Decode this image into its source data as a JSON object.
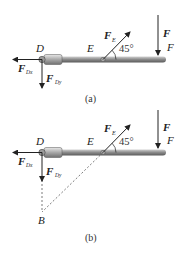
{
  "figure_a": {
    "caption": "(a)",
    "points": {
      "D": "D",
      "E": "E",
      "F": "F"
    },
    "forces": {
      "F_E": {
        "main": "F",
        "sub": "E"
      },
      "F": {
        "main": "F"
      },
      "F_Dx": {
        "main": "F",
        "sub": "Dx"
      },
      "F_Dy": {
        "main": "F",
        "sub": "Dy"
      }
    },
    "angle": "45°"
  },
  "figure_b": {
    "caption": "(b)",
    "points": {
      "D": "D",
      "E": "E",
      "F": "F",
      "B": "B"
    },
    "forces": {
      "F_E": {
        "main": "F",
        "sub": "E"
      },
      "F": {
        "main": "F"
      },
      "F_Dx": {
        "main": "F",
        "sub": "Dx"
      },
      "F_Dy": {
        "main": "F",
        "sub": "Dy"
      }
    },
    "angle": "45°"
  },
  "colors": {
    "bar": "#7a7a7a",
    "bar_light": "#bdbdbd",
    "ink": "#222222"
  }
}
